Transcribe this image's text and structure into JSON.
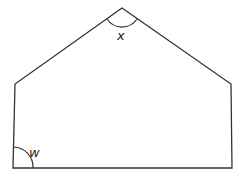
{
  "diagram": {
    "shape": "pentagon",
    "angle_labels": {
      "apex": "x",
      "bottom_left": "w"
    },
    "stroke_color": "#333333"
  }
}
